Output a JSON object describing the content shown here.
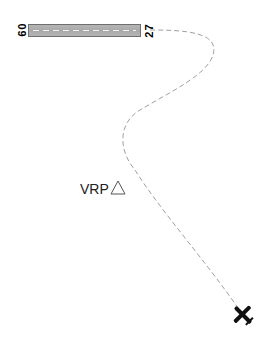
{
  "runway": {
    "left_designator": "09",
    "right_designator": "27",
    "surface_color": "#b0b0b0",
    "border_color": "#6f6f6f"
  },
  "waypoint": {
    "label": "VRP",
    "icon": "triangle-icon"
  },
  "flight_path": {
    "style": "dashed",
    "color": "#9a9a9a"
  },
  "aircraft": {
    "icon": "airplane-icon",
    "color": "#111111"
  }
}
